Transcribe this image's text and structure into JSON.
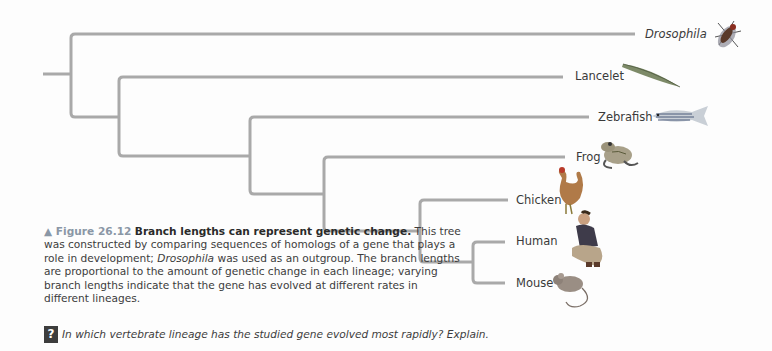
{
  "figure": {
    "label": "▲ Figure 26.12",
    "title": "Branch lengths can represent genetic change.",
    "caption_parts": {
      "p1": "This tree was constructed by comparing sequences of homologs of a gene that plays a role in development; ",
      "italic": "Drosophila",
      "p2": " was used as an outgroup. The branch lengths are proportional to the amount of genetic change in each lineage; varying branch lengths indicate that the gene has evolved at different rates in different lineages."
    },
    "question_icon": "?",
    "question": "In which vertebrate lineage has the studied gene evolved most rapidly? Explain."
  },
  "tree": {
    "line_color": "#a9a9a9",
    "taxa": [
      {
        "name": "Drosophila",
        "italic": true,
        "icon": "fruit-fly-icon"
      },
      {
        "name": "Lancelet",
        "italic": false,
        "icon": "lancelet-icon"
      },
      {
        "name": "Zebrafish",
        "italic": false,
        "icon": "zebrafish-icon"
      },
      {
        "name": "Frog",
        "italic": false,
        "icon": "frog-icon"
      },
      {
        "name": "Chicken",
        "italic": false,
        "icon": "chicken-icon"
      },
      {
        "name": "Human",
        "italic": false,
        "icon": "human-icon"
      },
      {
        "name": "Mouse",
        "italic": false,
        "icon": "mouse-icon"
      }
    ]
  }
}
